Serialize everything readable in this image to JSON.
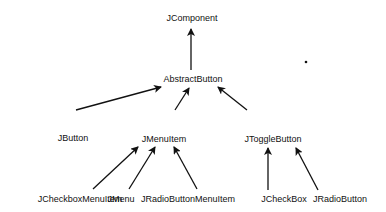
{
  "diagram": {
    "title": "",
    "type": "class-hierarchy",
    "nodes": [
      {
        "id": "jcomponent",
        "label": "JComponent",
        "x": 192,
        "y": 18
      },
      {
        "id": "abstractbutton",
        "label": "AbstractButton",
        "x": 193,
        "y": 79
      },
      {
        "id": "jbutton",
        "label": "JButton",
        "x": 73,
        "y": 138
      },
      {
        "id": "jmenuitem",
        "label": "JMenuItem",
        "x": 164,
        "y": 139
      },
      {
        "id": "jtogglebutton",
        "label": "JToggleButton",
        "x": 273,
        "y": 139
      },
      {
        "id": "jcheckboxmenuitem",
        "label": "JCheckboxMenuItem",
        "x": 80,
        "y": 199
      },
      {
        "id": "jmenu",
        "label": "JMenu",
        "x": 121,
        "y": 199
      },
      {
        "id": "jradiobuttonmenuitem",
        "label": "JRadioButtonMenuItem",
        "x": 188,
        "y": 199
      },
      {
        "id": "jcheckbox",
        "label": "JCheckBox",
        "x": 284,
        "y": 199
      },
      {
        "id": "jradiobutton",
        "label": "JRadioButton",
        "x": 340,
        "y": 199
      }
    ],
    "edges": [
      {
        "from": "abstractbutton",
        "to": "jcomponent",
        "x1": 191,
        "y1": 70,
        "x2": 191,
        "y2": 29
      },
      {
        "from": "jbutton",
        "to": "abstractbutton",
        "x1": 76,
        "y1": 110,
        "x2": 161,
        "y2": 87
      },
      {
        "from": "jmenuitem",
        "to": "abstractbutton",
        "x1": 175,
        "y1": 110,
        "x2": 189,
        "y2": 88
      },
      {
        "from": "jtogglebutton",
        "to": "abstractbutton",
        "x1": 247,
        "y1": 110,
        "x2": 218,
        "y2": 87
      },
      {
        "from": "jcheckboxmenuitem",
        "to": "jmenuitem",
        "x1": 93,
        "y1": 189,
        "x2": 138,
        "y2": 147
      },
      {
        "from": "jmenu",
        "to": "jmenuitem",
        "x1": 129,
        "y1": 189,
        "x2": 155,
        "y2": 147
      },
      {
        "from": "jradiobuttonmenuitem",
        "to": "jmenuitem",
        "x1": 197,
        "y1": 189,
        "x2": 174,
        "y2": 147
      },
      {
        "from": "jcheckbox",
        "to": "jtogglebutton",
        "x1": 268,
        "y1": 190,
        "x2": 268,
        "y2": 148
      },
      {
        "from": "jradiobutton",
        "to": "jtogglebutton",
        "x1": 318,
        "y1": 190,
        "x2": 296,
        "y2": 148
      }
    ],
    "stray_dot": {
      "x": 306,
      "y": 62
    }
  }
}
